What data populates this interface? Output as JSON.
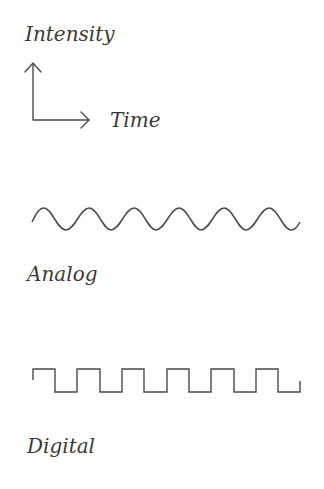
{
  "axes": {
    "y_label": "Intensity",
    "x_label": "Time"
  },
  "signals": [
    {
      "name": "Analog",
      "type": "sine",
      "periods": 6
    },
    {
      "name": "Digital",
      "type": "square",
      "periods": 6
    }
  ],
  "colors": {
    "stroke": "#4a4a4a",
    "text": "#3a3a3a",
    "background": "#ffffff"
  }
}
